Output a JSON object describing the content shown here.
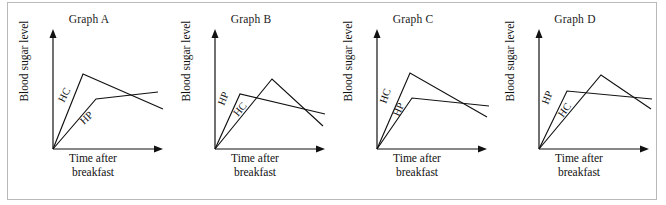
{
  "figure": {
    "border_color": "#b9b9b9",
    "background": "#ffffff",
    "line_color": "#111111"
  },
  "axis_labels": {
    "y": "Blood sugar level",
    "x_line1": "Time after",
    "x_line2": "breakfast"
  },
  "series_names": {
    "hc": "HC",
    "hp": "HP"
  },
  "panels": [
    {
      "id": "graph-a",
      "title": "Graph A",
      "hc_path": "M 0,0 L 30,75 L 110,40",
      "hp_path": "M 0,0 L 43,50 L 105,57",
      "hc_label": {
        "x": 11,
        "y": 46,
        "rotate": -63
      },
      "hp_label": {
        "x": 31,
        "y": 24,
        "rotate": -44
      }
    },
    {
      "id": "graph-b",
      "title": "Graph B",
      "hc_path": "M 0,0 L 57,70 L 108,23",
      "hp_path": "M 0,0 L 25,55 L 110,35",
      "hc_label": {
        "x": 23,
        "y": 32,
        "rotate": -50
      },
      "hp_label": {
        "x": 9,
        "y": 43,
        "rotate": -68
      }
    },
    {
      "id": "graph-c",
      "title": "Graph C",
      "hc_path": "M 0,0 L 33,76 L 110,32",
      "hp_path": "M 0,0 L 35,51 L 112,43",
      "hc_label": {
        "x": 9,
        "y": 45,
        "rotate": -70
      },
      "hp_label": {
        "x": 22,
        "y": 32,
        "rotate": -66
      }
    },
    {
      "id": "graph-d",
      "title": "Graph D",
      "hc_path": "M 0,0 L 62,74 L 112,40",
      "hp_path": "M 0,0 L 28,58 L 113,50",
      "hc_label": {
        "x": 24,
        "y": 31,
        "rotate": -54
      },
      "hp_label": {
        "x": 9,
        "y": 44,
        "rotate": -69
      }
    }
  ],
  "chart_data": {
    "type": "line",
    "title": "",
    "xlabel": "Time after breakfast",
    "ylabel": "Blood sugar level",
    "grid": false,
    "legend": "inline-curve-labels",
    "axis_ticks": false,
    "xlim": [
      0,
      120
    ],
    "ylim": [
      0,
      100
    ],
    "panels": [
      {
        "title": "Graph A",
        "series": [
          {
            "name": "HC",
            "x": [
              0,
              30,
              110
            ],
            "y": [
              0,
              75,
              40
            ]
          },
          {
            "name": "HP",
            "x": [
              0,
              43,
              105
            ],
            "y": [
              0,
              50,
              57
            ]
          }
        ]
      },
      {
        "title": "Graph B",
        "series": [
          {
            "name": "HC",
            "x": [
              0,
              57,
              108
            ],
            "y": [
              0,
              70,
              23
            ]
          },
          {
            "name": "HP",
            "x": [
              0,
              25,
              110
            ],
            "y": [
              0,
              55,
              35
            ]
          }
        ]
      },
      {
        "title": "Graph C",
        "series": [
          {
            "name": "HC",
            "x": [
              0,
              33,
              110
            ],
            "y": [
              0,
              76,
              32
            ]
          },
          {
            "name": "HP",
            "x": [
              0,
              35,
              112
            ],
            "y": [
              0,
              51,
              43
            ]
          }
        ]
      },
      {
        "title": "Graph D",
        "series": [
          {
            "name": "HC",
            "x": [
              0,
              62,
              112
            ],
            "y": [
              0,
              74,
              40
            ]
          },
          {
            "name": "HP",
            "x": [
              0,
              28,
              113
            ],
            "y": [
              0,
              58,
              50
            ]
          }
        ]
      }
    ]
  }
}
